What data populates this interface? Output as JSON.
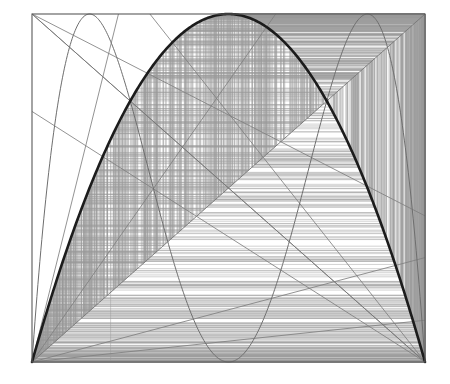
{
  "figure": {
    "type": "cobweb-orbit-plot",
    "background_color": "#ffffff"
  },
  "plot_box": {
    "left_px": 32,
    "top_px": 14,
    "right_px": 425,
    "bottom_px": 362,
    "frame_color": "#5a5a5a",
    "frame_width_px": 1.1
  },
  "axes": {
    "xlim": [
      0,
      1
    ],
    "ylim": [
      0,
      1
    ],
    "xlabel": "",
    "ylabel": "",
    "tick_labels_x": [],
    "tick_labels_y": [],
    "grid": false
  },
  "chart_data": {
    "type": "line",
    "xlabel": "",
    "ylabel": "",
    "xlim": [
      0,
      1
    ],
    "ylim": [
      0,
      1
    ],
    "grid": false,
    "legend": [],
    "series": [
      {
        "name": "f(x) = r x (1 - x)",
        "role": "map-curve-primary",
        "color": "#1c1c1c",
        "width_px": 2.6,
        "r": 4.0,
        "samples": 240,
        "anchor_points": [
          {
            "x": 0.0,
            "y": 0.0
          },
          {
            "x": 0.25,
            "y": 0.75
          },
          {
            "x": 0.5,
            "y": 1.0
          },
          {
            "x": 0.75,
            "y": 0.75
          },
          {
            "x": 1.0,
            "y": 0.0
          }
        ]
      },
      {
        "name": "f2(x) = f(f(x))",
        "role": "map-curve-secondary",
        "color": "#6e6e6e",
        "width_px": 1.0,
        "r": 4.0,
        "samples": 400,
        "anchor_points": [
          {
            "x": 0.0,
            "y": 0.0
          },
          {
            "x": 0.1464,
            "y": 1.0
          },
          {
            "x": 0.5,
            "y": 0.0
          },
          {
            "x": 0.8536,
            "y": 1.0
          },
          {
            "x": 1.0,
            "y": 0.0
          }
        ]
      },
      {
        "name": "identity y = x",
        "role": "axis-diagonal",
        "color": "#777777",
        "width_px": 0.9,
        "points": [
          {
            "x": 0.0,
            "y": 0.0
          },
          {
            "x": 1.0,
            "y": 1.0
          }
        ]
      },
      {
        "name": "anti-diagonal y = 1 - x",
        "role": "axis-diagonal",
        "color": "#777777",
        "width_px": 0.9,
        "points": [
          {
            "x": 0.0,
            "y": 1.0
          },
          {
            "x": 1.0,
            "y": 0.0
          }
        ]
      }
    ],
    "corner_rays": [
      {
        "name": "ray-origin-to-upper-mid",
        "from": {
          "x": 0.0,
          "y": 0.0
        },
        "to": {
          "x": 0.62,
          "y": 1.0
        }
      },
      {
        "name": "ray-origin-to-right-mid",
        "from": {
          "x": 0.0,
          "y": 0.0
        },
        "to": {
          "x": 1.0,
          "y": 0.3
        }
      },
      {
        "name": "ray-origin-to-right-low",
        "from": {
          "x": 0.0,
          "y": 0.0
        },
        "to": {
          "x": 1.0,
          "y": 0.12
        }
      },
      {
        "name": "ray-origin-steep",
        "from": {
          "x": 0.0,
          "y": 0.0
        },
        "to": {
          "x": 0.22,
          "y": 1.0
        }
      },
      {
        "name": "ray-topleft-to-right",
        "from": {
          "x": 0.0,
          "y": 1.0
        },
        "to": {
          "x": 1.0,
          "y": 0.42
        }
      },
      {
        "name": "ray-topleft-to-bottomright",
        "from": {
          "x": 0.0,
          "y": 1.0
        },
        "to": {
          "x": 1.0,
          "y": 0.0
        }
      },
      {
        "name": "ray-bottomright-to-topleft-steep",
        "from": {
          "x": 1.0,
          "y": 0.0
        },
        "to": {
          "x": 0.3,
          "y": 1.0
        }
      },
      {
        "name": "ray-bottomright-to-left-mid",
        "from": {
          "x": 1.0,
          "y": 0.0
        },
        "to": {
          "x": 0.0,
          "y": 0.72
        }
      }
    ],
    "cobweb": {
      "name": "chaotic-orbit-cobweb",
      "r": 4.0,
      "x0": 0.2000001,
      "iterations": 900,
      "skip_transient": 0,
      "color": "#9a9a9a",
      "width_px": 0.55,
      "description": "Staircase of alternating vertical (x,x)->(x,f(x)) and horizontal (x,f(x))->(f(x),f(x)) segments filling the unit square."
    }
  }
}
